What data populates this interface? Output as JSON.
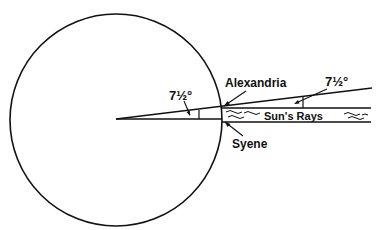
{
  "diagram": {
    "labels": {
      "alexandria": "Alexandria",
      "syene": "Syene",
      "suns_rays": "Sun's Rays",
      "angle_center": "7½°",
      "angle_ray": "7½°"
    },
    "colors": {
      "line": "#111111",
      "background": "#ffffff"
    }
  }
}
